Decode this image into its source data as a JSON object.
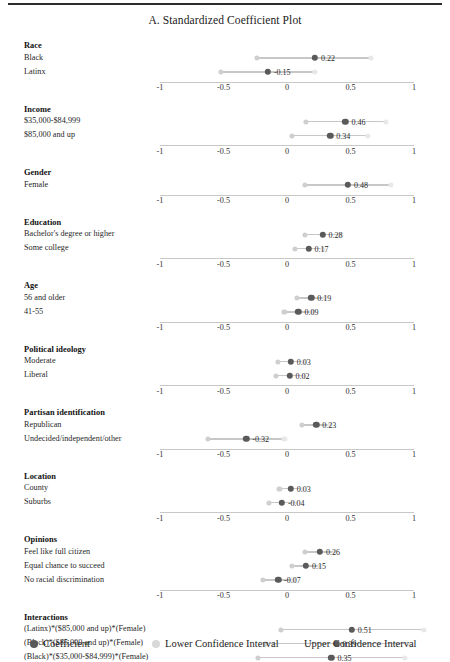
{
  "figure": {
    "title": "A. Standardized Coefficient Plot",
    "axis_label_left": "-1",
    "rule": "top-rule"
  },
  "legend": {
    "coefficient": "Coefficient",
    "lower_ci": "Lower Confidence Interval",
    "upper_ci": "Upper Confidence Interval"
  },
  "colors": {
    "coefficient_dot": "#5a5a5a",
    "lower_ci_dot": "#cfcfcf",
    "upper_ci_dot": "#e8e8e8",
    "ci_line": "#bdbdbd",
    "axis": "#9a9a9a",
    "text": "#1a1a1a"
  },
  "chart_data": {
    "type": "scatter",
    "title": "A. Standardized Coefficient Plot",
    "xlabel": "",
    "ylabel": "",
    "xlim": [
      -1,
      1
    ],
    "xticks": [
      -1,
      -0.5,
      0,
      0.5,
      1
    ],
    "xtick_labels": [
      "-1",
      "-0.5",
      "0",
      "0.5",
      "1"
    ],
    "grid": false,
    "legend_position": "bottom",
    "series": [
      {
        "name": "Coefficient",
        "color": "#5a5a5a"
      },
      {
        "name": "Lower Confidence Interval",
        "color": "#cfcfcf"
      },
      {
        "name": "Upper Confidence Interval",
        "color": "#e8e8e8"
      }
    ],
    "groups": [
      {
        "group": "Race",
        "rows": [
          {
            "label": "Black",
            "coefficient": 0.22,
            "label_text": "0.22",
            "lower": -0.24,
            "upper": 0.66
          },
          {
            "label": "Latinx",
            "coefficient": -0.15,
            "label_text": "-0.15",
            "lower": -0.52,
            "upper": 0.22
          }
        ]
      },
      {
        "group": "Income",
        "rows": [
          {
            "label": "$35,000-$84,999",
            "coefficient": 0.46,
            "label_text": "0.46",
            "lower": 0.15,
            "upper": 0.78
          },
          {
            "label": "$85,000 and up",
            "coefficient": 0.34,
            "label_text": "0.34",
            "lower": 0.04,
            "upper": 0.64
          }
        ]
      },
      {
        "group": "Gender",
        "rows": [
          {
            "label": "Female",
            "coefficient": 0.48,
            "label_text": "0.48",
            "lower": 0.14,
            "upper": 0.82
          }
        ]
      },
      {
        "group": "Education",
        "rows": [
          {
            "label": "Bachelor's degree or higher",
            "coefficient": 0.28,
            "label_text": "0.28",
            "lower": 0.14,
            "upper": 0.42
          },
          {
            "label": "Some college",
            "coefficient": 0.17,
            "label_text": "0.17",
            "lower": 0.06,
            "upper": 0.28
          }
        ]
      },
      {
        "group": "Age",
        "rows": [
          {
            "label": "56 and older",
            "coefficient": 0.19,
            "label_text": "0.19",
            "lower": 0.08,
            "upper": 0.3
          },
          {
            "label": "41-55",
            "coefficient": 0.09,
            "label_text": "0.09",
            "lower": -0.02,
            "upper": 0.2
          }
        ]
      },
      {
        "group": "Political ideology",
        "rows": [
          {
            "label": "Moderate",
            "coefficient": 0.03,
            "label_text": "0.03",
            "lower": -0.07,
            "upper": 0.13
          },
          {
            "label": "Liberal",
            "coefficient": 0.02,
            "label_text": "0.02",
            "lower": -0.09,
            "upper": 0.13
          }
        ]
      },
      {
        "group": "Partisan identification",
        "rows": [
          {
            "label": "Republican",
            "coefficient": 0.23,
            "label_text": "0.23",
            "lower": 0.12,
            "upper": 0.34
          },
          {
            "label": "Undecided/independent/other",
            "coefficient": -0.32,
            "label_text": "-0.32",
            "lower": -0.62,
            "upper": -0.02
          }
        ]
      },
      {
        "group": "Location",
        "rows": [
          {
            "label": "County",
            "coefficient": 0.03,
            "label_text": "0.03",
            "lower": -0.06,
            "upper": 0.12
          },
          {
            "label": "Suburbs",
            "coefficient": -0.04,
            "label_text": "-0.04",
            "lower": -0.14,
            "upper": 0.06
          }
        ]
      },
      {
        "group": "Opinions",
        "rows": [
          {
            "label": "Feel like full citizen",
            "coefficient": 0.26,
            "label_text": "0.26",
            "lower": 0.14,
            "upper": 0.38
          },
          {
            "label": "Equal chance to succeed",
            "coefficient": 0.15,
            "label_text": "0.15",
            "lower": 0.04,
            "upper": 0.26
          },
          {
            "label": "No racial discrimination",
            "coefficient": -0.07,
            "label_text": "-0.07",
            "lower": -0.19,
            "upper": 0.05
          }
        ]
      },
      {
        "group": "Interactions",
        "rows": [
          {
            "label": "(Latinx)*($85,000 and up)*(Female)",
            "coefficient": 0.51,
            "label_text": "0.51",
            "lower": -0.05,
            "upper": 1.08
          },
          {
            "label": "(Black)*($85,000 and up)*(Female)",
            "coefficient": 0.39,
            "label_text": "0.39",
            "lower": -0.17,
            "upper": 0.95
          },
          {
            "label": "(Black)*($35,000-$84,999)*(Female)",
            "coefficient": 0.35,
            "label_text": "0.35",
            "lower": -0.23,
            "upper": 0.93
          },
          {
            "label": "(Latinx)*($35,000-$84,999)*(Female)",
            "coefficient": 0.29,
            "label_text": "0.29",
            "lower": -0.2,
            "upper": 0.78
          },
          {
            "label": "(Black)*($85,000 and up)",
            "coefficient": -0.03,
            "label_text": "-0.03",
            "lower": -0.52,
            "upper": 0.46
          },
          {
            "label": "(Latinx)*($85,000 and up)",
            "coefficient": -0.04,
            "label_text": "-0.04",
            "lower": -0.46,
            "upper": 0.38
          },
          {
            "label": "(Latinx)*($35,000-$84,999)",
            "coefficient": -0.06,
            "label_text": "-0.06",
            "lower": -0.48,
            "upper": 0.36
          },
          {
            "label": "(Black)*($35,000-$84,999)",
            "coefficient": -0.22,
            "label_text": "-0.22",
            "lower": -0.7,
            "upper": 0.27
          },
          {
            "label": "(Black)*(Female)",
            "coefficient": -0.32,
            "label_text": "-0.32",
            "lower": -0.83,
            "upper": 0.19
          },
          {
            "label": "(Latinx)*(Female)",
            "coefficient": -0.35,
            "label_text": "-0.35",
            "lower": -0.72,
            "upper": 0.02
          },
          {
            "label": "($85,000 and up)*(Female)",
            "coefficient": -0.46,
            "label_text": "-0.46",
            "lower": -0.86,
            "upper": -0.06
          },
          {
            "label": "($35,000-$84,999)*(Female)",
            "coefficient": -0.6,
            "label_text": "-0.6",
            "lower": -1.0,
            "upper": -0.2
          }
        ]
      }
    ],
    "panels": [
      {
        "name": "Race",
        "axis_after": true
      },
      {
        "name": "Income",
        "axis_after": true
      },
      {
        "name": "Gender",
        "axis_after": true
      },
      {
        "name": "Education",
        "axis_after": true
      },
      {
        "name": "Age",
        "axis_after": true
      },
      {
        "name": "Political ideology",
        "axis_after": true
      },
      {
        "name": "Partisan identification",
        "axis_after": true
      },
      {
        "name": "Location",
        "axis_after": true
      },
      {
        "name": "Opinions",
        "axis_after": true
      },
      {
        "name": "Interactions",
        "axis_after": true
      }
    ]
  }
}
